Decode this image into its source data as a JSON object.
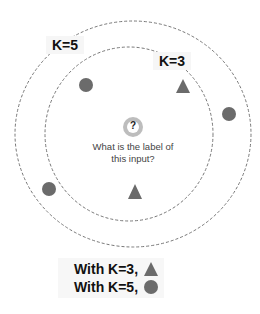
{
  "labels": {
    "k5": "K=5",
    "k3": "K=3"
  },
  "query": {
    "symbol": "?",
    "text_line1": "What is the label of",
    "text_line2": "this input?"
  },
  "results": [
    {
      "text": "With K=3,",
      "shape": "triangle"
    },
    {
      "text": "With K=5,",
      "shape": "circle"
    }
  ],
  "colors": {
    "point": "#6b6b6b",
    "query_ring": "#bdbdbd",
    "dashed": "#777777"
  },
  "points": [
    {
      "shape": "circle",
      "x": 86,
      "y": 85
    },
    {
      "shape": "triangle",
      "x": 183,
      "y": 87
    },
    {
      "shape": "circle",
      "x": 229,
      "y": 114
    },
    {
      "shape": "circle",
      "x": 49,
      "y": 189
    },
    {
      "shape": "triangle",
      "x": 135,
      "y": 192
    }
  ]
}
